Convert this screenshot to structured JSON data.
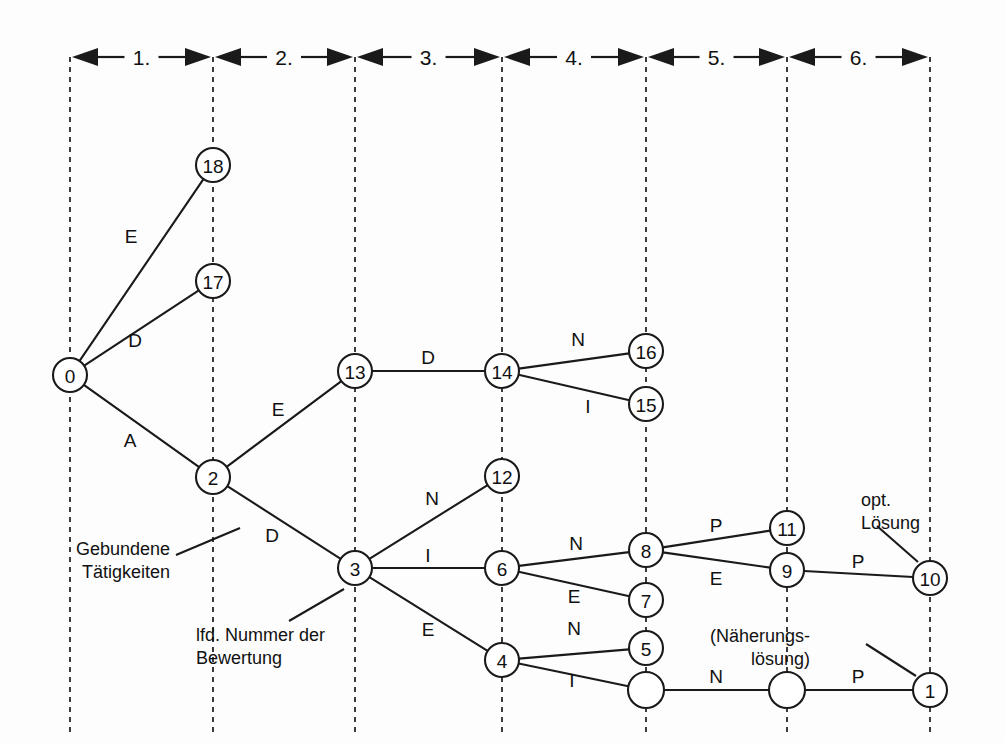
{
  "figure": {
    "type": "tree-search-diagram",
    "title_present": false,
    "background_color": "#fdfdfd",
    "ink_color": "#1a1a1a"
  },
  "stage_axis": {
    "labels": [
      "1.",
      "2.",
      "3.",
      "4.",
      "5.",
      "6."
    ],
    "boundaries_x": [
      70,
      213,
      355,
      502,
      646,
      787,
      930
    ],
    "y": 57
  },
  "guides": {
    "x_positions": [
      70,
      213,
      355,
      502,
      646,
      787,
      930
    ],
    "y_top": 57,
    "y_bottom": 735
  },
  "nodes": [
    {
      "id": "n0",
      "label": "0",
      "x": 70,
      "y": 375,
      "r": 17
    },
    {
      "id": "n18",
      "label": "18",
      "x": 213,
      "y": 165,
      "r": 17
    },
    {
      "id": "n17",
      "label": "17",
      "x": 213,
      "y": 281,
      "r": 17
    },
    {
      "id": "n2",
      "label": "2",
      "x": 213,
      "y": 477,
      "r": 17
    },
    {
      "id": "n13",
      "label": "13",
      "x": 355,
      "y": 371,
      "r": 17
    },
    {
      "id": "n3",
      "label": "3",
      "x": 355,
      "y": 568,
      "r": 17
    },
    {
      "id": "n14",
      "label": "14",
      "x": 502,
      "y": 371,
      "r": 17
    },
    {
      "id": "n12",
      "label": "12",
      "x": 502,
      "y": 476,
      "r": 17
    },
    {
      "id": "n6",
      "label": "6",
      "x": 502,
      "y": 568,
      "r": 17
    },
    {
      "id": "n4",
      "label": "4",
      "x": 502,
      "y": 660,
      "r": 17
    },
    {
      "id": "n16",
      "label": "16",
      "x": 646,
      "y": 351,
      "r": 17
    },
    {
      "id": "n15",
      "label": "15",
      "x": 646,
      "y": 404,
      "r": 17
    },
    {
      "id": "n8",
      "label": "8",
      "x": 646,
      "y": 550,
      "r": 17
    },
    {
      "id": "n7",
      "label": "7",
      "x": 646,
      "y": 600,
      "r": 17
    },
    {
      "id": "n5",
      "label": "5",
      "x": 646,
      "y": 648,
      "r": 17
    },
    {
      "id": "nA",
      "label": "",
      "x": 646,
      "y": 690,
      "r": 18
    },
    {
      "id": "n11",
      "label": "11",
      "x": 787,
      "y": 528,
      "r": 17
    },
    {
      "id": "n9",
      "label": "9",
      "x": 787,
      "y": 570,
      "r": 17
    },
    {
      "id": "nB",
      "label": "",
      "x": 787,
      "y": 690,
      "r": 18
    },
    {
      "id": "n10",
      "label": "10",
      "x": 930,
      "y": 578,
      "r": 17
    },
    {
      "id": "n1",
      "label": "1",
      "x": 930,
      "y": 690,
      "r": 17
    }
  ],
  "edges": [
    {
      "from": "n0",
      "to": "n18",
      "label": "E",
      "lx": 131,
      "ly": 236
    },
    {
      "from": "n0",
      "to": "n17",
      "label": "D",
      "lx": 135,
      "ly": 340
    },
    {
      "from": "n0",
      "to": "n2",
      "label": "A",
      "lx": 130,
      "ly": 440
    },
    {
      "from": "n2",
      "to": "n13",
      "label": "E",
      "lx": 278,
      "ly": 409
    },
    {
      "from": "n2",
      "to": "n3",
      "label": "D",
      "lx": 272,
      "ly": 535
    },
    {
      "from": "n13",
      "to": "n14",
      "label": "D",
      "lx": 428,
      "ly": 357
    },
    {
      "from": "n14",
      "to": "n16",
      "label": "N",
      "lx": 578,
      "ly": 339
    },
    {
      "from": "n14",
      "to": "n15",
      "label": "I",
      "lx": 588,
      "ly": 406
    },
    {
      "from": "n3",
      "to": "n12",
      "label": "N",
      "lx": 432,
      "ly": 498
    },
    {
      "from": "n3",
      "to": "n6",
      "label": "I",
      "lx": 428,
      "ly": 555
    },
    {
      "from": "n3",
      "to": "n4",
      "label": "E",
      "lx": 428,
      "ly": 629
    },
    {
      "from": "n6",
      "to": "n8",
      "label": "N",
      "lx": 576,
      "ly": 543
    },
    {
      "from": "n6",
      "to": "n7",
      "label": "E",
      "lx": 574,
      "ly": 596
    },
    {
      "from": "n4",
      "to": "n5",
      "label": "N",
      "lx": 574,
      "ly": 628
    },
    {
      "from": "n4",
      "to": "nA",
      "label": "I",
      "lx": 572,
      "ly": 680
    },
    {
      "from": "n8",
      "to": "n11",
      "label": "P",
      "lx": 716,
      "ly": 525
    },
    {
      "from": "n8",
      "to": "n9",
      "label": "E",
      "lx": 716,
      "ly": 578
    },
    {
      "from": "n9",
      "to": "n10",
      "label": "P",
      "lx": 858,
      "ly": 561
    },
    {
      "from": "nA",
      "to": "nB",
      "label": "N",
      "lx": 716,
      "ly": 676
    },
    {
      "from": "nB",
      "to": "n1",
      "label": "P",
      "lx": 858,
      "ly": 676
    }
  ],
  "annotations": [
    {
      "id": "gebundene",
      "lines": [
        "Gebundene",
        "Tätigkeiten"
      ],
      "x": 170,
      "y": 549,
      "align": "end",
      "leader": {
        "x1": 176,
        "y1": 555,
        "x2": 240,
        "y2": 528
      }
    },
    {
      "id": "lfd-nummer",
      "lines": [
        "lfd. Nummer der",
        "Bewertung"
      ],
      "x": 196,
      "y": 635,
      "align": "start",
      "leader": {
        "x1": 289,
        "y1": 621,
        "x2": 344,
        "y2": 589
      }
    },
    {
      "id": "opt-loesung",
      "lines": [
        "opt.",
        "Lösung"
      ],
      "x": 861,
      "y": 500,
      "align": "start",
      "leader": {
        "x1": 877,
        "y1": 526,
        "x2": 918,
        "y2": 562
      }
    },
    {
      "id": "naeherungsloesung",
      "lines": [
        "(Näherungs-",
        "lösung)"
      ],
      "x": 810,
      "y": 636,
      "align": "end",
      "leader": {
        "x1": 866,
        "y1": 644,
        "x2": 916,
        "y2": 676
      }
    }
  ]
}
